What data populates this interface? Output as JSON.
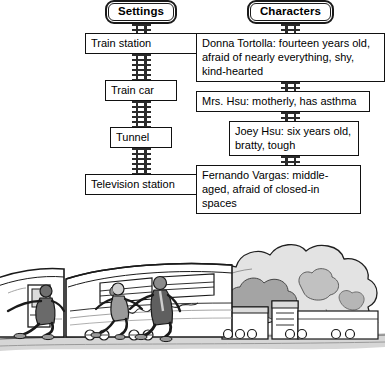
{
  "diagram": {
    "settings": {
      "header": "Settings",
      "items": [
        {
          "label": "Train station"
        },
        {
          "label": "Train car"
        },
        {
          "label": "Tunnel"
        },
        {
          "label": "Television station"
        }
      ]
    },
    "characters": {
      "header": "Characters",
      "items": [
        {
          "label": "Donna Tortolla: fourteen years old, afraid of nearly everything, shy, kind-hearted"
        },
        {
          "label": "Mrs. Hsu: motherly, has asthma"
        },
        {
          "label": "Joey Hsu: six years old, bratty, tough"
        },
        {
          "label": "Fernando Vargas: middle-aged, afraid of closed-in spaces"
        }
      ]
    },
    "connector": "railroad-track"
  },
  "illustration": {
    "name": "train-with-people-running-and-smoke",
    "description": "Grayscale line drawing of three people running away from a passenger train car on tracks, with billowing smoke clouds rising behind the locomotive on the right",
    "colors": {
      "line": "#1a1a1a",
      "mid_gray": "#8c8c8c",
      "light_gray": "#c9c9c9",
      "pale_gray": "#e6e6e6"
    }
  },
  "theme": {
    "background": "#ffffff",
    "text": "#000000",
    "border": "#111111",
    "rail": "#2b2b2b"
  }
}
